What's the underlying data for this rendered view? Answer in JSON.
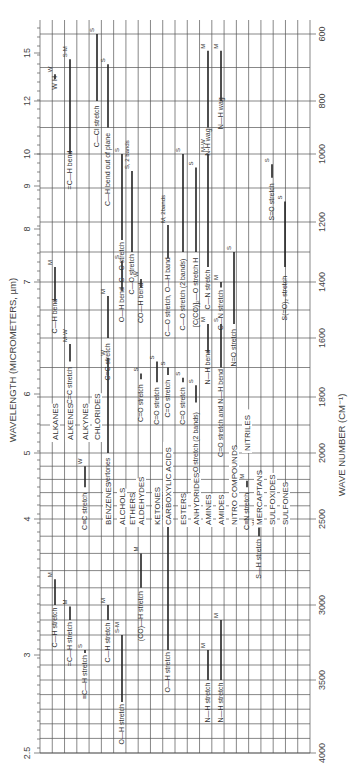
{
  "chart_data": {
    "type": "table",
    "orientation": "rotated 90° (wavelength increases upward)",
    "xlabel": "WAVELENGTH (MICROMETERS, µm)",
    "ylabel": "WAVE NUMBER (CM⁻¹)",
    "wavelength_ticks": [
      "2.5",
      "3",
      "4",
      "5",
      "6",
      "7",
      "8",
      "9",
      "10",
      "12",
      "15"
    ],
    "wavenumber_ticks": [
      "4000",
      "3500",
      "3000",
      "2500",
      "2000",
      "1800",
      "1600",
      "1400",
      "1200",
      "1000",
      "800",
      "600"
    ],
    "grid": true,
    "compound_classes": [
      "ALKANES",
      "ALKENES",
      "ALKYNES",
      "CHLORIDES",
      "BENZENES",
      "ALCHOLS",
      "ETHERS",
      "ALDEHYDES",
      "KETONES",
      "CARBOXYLIC ACIDS",
      "ESTERS",
      "ANHYDRIDES",
      "AMINES",
      "AMIDES",
      "NITRO COMPOUNDS",
      "NITRILES",
      "MERCAPTANS",
      "SULFOXIDES",
      "SULFONES"
    ],
    "bands": [
      {
        "class": "ALKANES",
        "label": "C—H stretch",
        "intensity": "M",
        "wavenumber_range": [
          2850,
          3000
        ]
      },
      {
        "class": "ALKANES",
        "label": "C—H bend",
        "intensity": "M",
        "wavenumber_range": [
          1350,
          1470
        ]
      },
      {
        "class": "ALKANES",
        "label": "W H",
        "intensity": "W",
        "wavenumber_range": [
          720,
          725
        ]
      },
      {
        "class": "ALKENES",
        "label": "=C—H stretch",
        "intensity": "M",
        "wavenumber_range": [
          3010,
          3100
        ]
      },
      {
        "class": "ALKENES",
        "label": "C=C stretch",
        "intensity": "M-W",
        "wavenumber_range": [
          1620,
          1680
        ]
      },
      {
        "class": "ALKENES",
        "label": "=C—H bend",
        "intensity": "S-M",
        "wavenumber_range": [
          675,
          1000
        ]
      },
      {
        "class": "ALKYNES",
        "label": "≡C—H stretch",
        "intensity": "S",
        "wavenumber_range": [
          3300,
          3320
        ]
      },
      {
        "class": "ALKYNES",
        "label": "C≡C stretch",
        "intensity": "W",
        "wavenumber_range": [
          2100,
          2260
        ]
      },
      {
        "class": "CHLORIDES",
        "label": "C—Cl stretch",
        "intensity": "S",
        "wavenumber_range": [
          600,
          800
        ]
      },
      {
        "class": "BENZENES",
        "label": "C—H stretch",
        "intensity": "M",
        "wavenumber_range": [
          3000,
          3100
        ]
      },
      {
        "class": "BENZENES",
        "label": "C=C stretch",
        "intensity": "M",
        "wavenumber_range": [
          1450,
          1600
        ]
      },
      {
        "class": "BENZENES",
        "label": "overtones",
        "intensity": "W",
        "wavenumber_range": [
          1667,
          2000
        ]
      },
      {
        "class": "BENZENES",
        "label": "C—H bend out of plane",
        "intensity": "S",
        "wavenumber_range": [
          690,
          900
        ]
      },
      {
        "class": "ALCHOLS",
        "label": "O—H stretch",
        "intensity": "S-M",
        "wavenumber_range": [
          3200,
          3650
        ]
      },
      {
        "class": "ALCHOLS",
        "label": "O—H bend",
        "intensity": "S",
        "wavenumber_range": [
          1330,
          1430
        ]
      },
      {
        "class": "ALCHOLS",
        "label": "C—O stretch",
        "intensity": "S",
        "wavenumber_range": [
          1000,
          1260
        ]
      },
      {
        "class": "ETHERS",
        "label": "C—O stretch",
        "intensity": "S, 2 bands",
        "wavenumber_range": [
          1050,
          1300
        ]
      },
      {
        "class": "ALDEHYDES",
        "label": "(CO)—H stretch",
        "intensity": "M",
        "wavenumber_range": [
          2700,
          2900
        ]
      },
      {
        "class": "ALDEHYDES",
        "label": "C=O stretch",
        "intensity": "S",
        "wavenumber_range": [
          1720,
          1740
        ]
      },
      {
        "class": "ALDEHYDES",
        "label": "CO—H bend",
        "intensity": "W",
        "wavenumber_range": [
          1390,
          1420
        ]
      },
      {
        "class": "KETONES",
        "label": "C=O stretch",
        "intensity": "S",
        "wavenumber_range": [
          1680,
          1750
        ]
      },
      {
        "class": "CARBOXYLIC ACIDS",
        "label": "O—H stretch",
        "intensity": "S, broad",
        "wavenumber_range": [
          2500,
          3300
        ]
      },
      {
        "class": "CARBOXYLIC ACIDS",
        "label": "C=O stretch",
        "intensity": "S",
        "wavenumber_range": [
          1700,
          1725
        ]
      },
      {
        "class": "CARBOXYLIC ACIDS",
        "label": "C—O stretch, O—H band",
        "intensity": "M, 2bands",
        "wavenumber_range": [
          1210,
          1320
        ]
      },
      {
        "class": "ESTERS",
        "label": "C=O stretch",
        "intensity": "S",
        "wavenumber_range": [
          1735,
          1750
        ]
      },
      {
        "class": "ESTERS",
        "label": "C—O stretch (2 bands)",
        "intensity": "S",
        "wavenumber_range": [
          1000,
          1300
        ]
      },
      {
        "class": "ANHYDRIDES",
        "label": "C=O stretch (2 bands)",
        "intensity": "S",
        "wavenumber_range": [
          1760,
          1820
        ]
      },
      {
        "class": "ANHYDRIDES",
        "label": "[C(CO)]₂—O stretch H",
        "intensity": "S",
        "wavenumber_range": [
          1040,
          1300
        ]
      },
      {
        "class": "AMINES",
        "label": "N—H stretch",
        "intensity": "M",
        "wavenumber_range": [
          3300,
          3500
        ]
      },
      {
        "class": "AMINES",
        "label": "N—H bend",
        "intensity": "M",
        "wavenumber_range": [
          1550,
          1650
        ]
      },
      {
        "class": "AMINES",
        "label": "C—N stretch",
        "intensity": "M-W",
        "wavenumber_range": [
          1000,
          1350
        ]
      },
      {
        "class": "AMINES",
        "label": "N-H wag",
        "intensity": "M",
        "wavenumber_range": [
          650,
          900
        ]
      },
      {
        "class": "AMIDES",
        "label": "N—H stretch",
        "intensity": "M",
        "wavenumber_range": [
          3100,
          3500
        ]
      },
      {
        "class": "AMIDES",
        "label": "C=O stretch and N—H bend",
        "intensity": "S",
        "wavenumber_range": [
          1550,
          1700
        ]
      },
      {
        "class": "AMIDES",
        "label": "C—N stretch",
        "intensity": "M",
        "wavenumber_range": [
          1400,
          1420
        ]
      },
      {
        "class": "AMIDES",
        "label": "N—H wag",
        "intensity": "M",
        "wavenumber_range": [
          650,
          800
        ]
      },
      {
        "class": "NITRO COMPOUNDS",
        "label": "N=O stretch",
        "intensity": "S",
        "wavenumber_range": [
          1300,
          1550
        ]
      },
      {
        "class": "NITRILES",
        "label": "C≡N stretch",
        "intensity": "M",
        "wavenumber_range": [
          2210,
          2260
        ]
      },
      {
        "class": "MERCAPTANS",
        "label": "S—H stretch",
        "intensity": "W",
        "wavenumber_range": [
          2550,
          2600
        ]
      },
      {
        "class": "SULFOXIDES",
        "label": "S=O stretch",
        "intensity": "S",
        "wavenumber_range": [
          1030,
          1070
        ]
      },
      {
        "class": "SULFONES",
        "label": "S(=O)₂ stretch",
        "intensity": "S",
        "wavenumber_range": [
          1140,
          1350
        ]
      }
    ]
  },
  "axes": {
    "wavelength_title": "WAVELENGTH (MICROMETERS, µm)",
    "wavenumber_title": "WAVE NUMBER (CM⁻¹)"
  }
}
